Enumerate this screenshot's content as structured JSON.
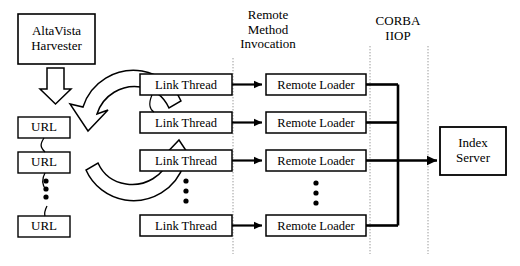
{
  "diagram": {
    "background_color": "#ffffff",
    "line_color": "#000000",
    "divider_color": "#9a9a9a",
    "headers": [
      {
        "id": "rmi",
        "text": "Remote\nMethod\nInvocation"
      },
      {
        "id": "corba",
        "text": "CORBA\nIIOP"
      }
    ],
    "dividers": [
      {
        "id": "rmi-divider-left",
        "x": 233
      },
      {
        "id": "corba-divider-left",
        "x": 370
      },
      {
        "id": "corba-divider-right",
        "x": 428
      }
    ],
    "nodes": {
      "harvester": {
        "label": "AltaVista\nHarvester"
      },
      "urls": [
        {
          "label": "URL"
        },
        {
          "label": "URL"
        },
        {
          "label": "URL"
        }
      ],
      "link_threads": [
        {
          "label": "Link Thread"
        },
        {
          "label": "Link Thread"
        },
        {
          "label": "Link Thread"
        },
        {
          "label": "Link Thread"
        }
      ],
      "remote_loaders": [
        {
          "label": "Remote Loader"
        },
        {
          "label": "Remote Loader"
        },
        {
          "label": "Remote Loader"
        },
        {
          "label": "Remote Loader"
        }
      ],
      "index_server": {
        "label": "Index\nServer"
      }
    },
    "ellipses": [
      {
        "id": "url-ellipsis",
        "dots": 3
      },
      {
        "id": "link-thread-ellipsis",
        "dots": 3
      },
      {
        "id": "remote-loader-ellipsis",
        "dots": 3
      }
    ],
    "icons": {
      "harvester_arrow": "block-down-arrow-icon",
      "recycle": "circular-recycle-arrows-icon"
    }
  }
}
